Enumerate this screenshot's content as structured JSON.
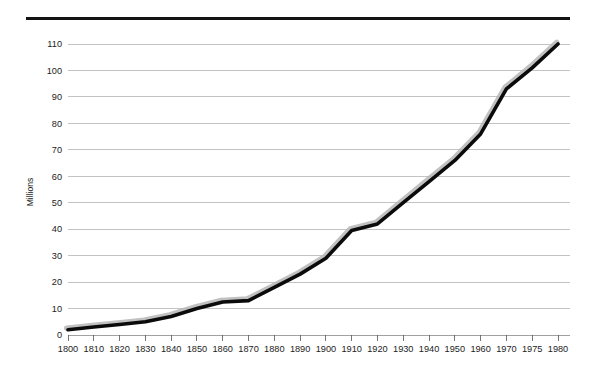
{
  "chart_data": {
    "type": "line",
    "title": "",
    "subtitle": "",
    "xlabel": "",
    "ylabel": "Millions",
    "categories": [
      "1800",
      "1810",
      "1820",
      "1830",
      "1840",
      "1850",
      "1860",
      "1870",
      "1880",
      "1890",
      "1900",
      "1910",
      "1920",
      "1930",
      "1940",
      "1950",
      "1960",
      "1970",
      "1975",
      "1980"
    ],
    "x": [
      1800,
      1810,
      1820,
      1830,
      1840,
      1850,
      1860,
      1870,
      1880,
      1890,
      1900,
      1910,
      1920,
      1930,
      1940,
      1950,
      1960,
      1970,
      1975,
      1980
    ],
    "values": [
      2,
      3,
      4,
      5,
      7,
      10,
      12.5,
      13,
      18,
      23,
      29,
      39.5,
      42,
      50,
      58,
      66,
      76,
      93,
      101,
      110
    ],
    "series": [
      {
        "name": "Millions",
        "values": [
          2,
          3,
          4,
          5,
          7,
          10,
          12.5,
          13,
          18,
          23,
          29,
          39.5,
          42,
          50,
          58,
          66,
          76,
          93,
          101,
          110
        ]
      }
    ],
    "ylim": [
      0,
      110
    ],
    "ytick_values": [
      0,
      10,
      20,
      30,
      40,
      50,
      60,
      70,
      80,
      90,
      100,
      110
    ],
    "ytick_labels": [
      "0",
      "10",
      "20",
      "30",
      "40",
      "50",
      "60",
      "70",
      "80",
      "90",
      "100",
      "110"
    ],
    "xtick_labels": [
      "1800",
      "1810",
      "1820",
      "1830",
      "1840",
      "1850",
      "1860",
      "1870",
      "1880",
      "1890",
      "1900",
      "1910",
      "1920",
      "1930",
      "1940",
      "1950",
      "1960",
      "1970",
      "1975",
      "1980"
    ],
    "grid": true,
    "grid_axis": "y",
    "legend": false,
    "legend_position": "none",
    "annotations": [],
    "colors": {
      "line": "#0b0b0b",
      "line_shadow": "#b6b6b6",
      "gridline": "#a9a9a9",
      "tick_mark": "#555555",
      "top_rule": "#131313",
      "text": "#1c1c1c",
      "background": "#ffffff"
    }
  },
  "figure": {
    "top_rule_present": true,
    "background_label": "white-page"
  }
}
